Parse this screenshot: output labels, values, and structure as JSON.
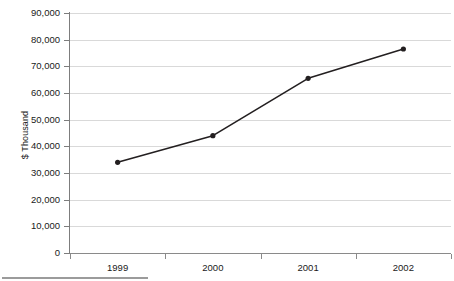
{
  "chart_data": {
    "type": "line",
    "title": "",
    "subtitle": "",
    "xlabel": "",
    "ylabel": "$ Thousand",
    "categories": [
      "1999",
      "2000",
      "2001",
      "2002"
    ],
    "series": [
      {
        "name": "",
        "values": [
          34000,
          44000,
          65500,
          76500
        ]
      }
    ],
    "ylim": [
      0,
      90000
    ],
    "yticks": [
      0,
      10000,
      20000,
      30000,
      40000,
      50000,
      60000,
      70000,
      80000,
      90000
    ],
    "ytick_labels": [
      "0",
      "10,000",
      "20,000",
      "30,000",
      "40,000",
      "50,000",
      "60,000",
      "70,000",
      "80,000",
      "90,000"
    ],
    "grid": true,
    "grid_axis": "y",
    "legend": false,
    "legend_position": "none",
    "markers": "filled-circle",
    "line_color": "#231f20",
    "marker_color": "#231f20",
    "gridline_color": "#d9d9d9",
    "axis_color": "#8a8a8a",
    "background_color": "#ffffff",
    "annotations": []
  }
}
